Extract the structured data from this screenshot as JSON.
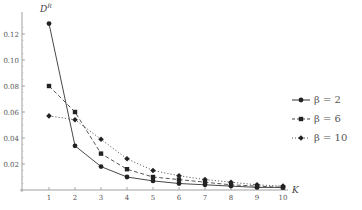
{
  "chart_data": {
    "type": "line",
    "title": "",
    "xlabel": "K",
    "ylabel": "D^R",
    "x": [
      1,
      2,
      3,
      4,
      5,
      6,
      7,
      8,
      9,
      10
    ],
    "xticks": [
      "1",
      "2",
      "3",
      "4",
      "5",
      "6",
      "7",
      "8",
      "9",
      "10"
    ],
    "yticks": [
      "0.02",
      "0.04",
      "0.06",
      "0.08",
      "0.10",
      "0.12"
    ],
    "ylim": [
      0,
      0.13
    ],
    "xlim": [
      0.5,
      10.5
    ],
    "grid": false,
    "legend_position": "right",
    "series": [
      {
        "name": "β = 2",
        "style": "solid",
        "marker": "circle",
        "values": [
          0.128,
          0.034,
          0.018,
          0.01,
          0.007,
          0.005,
          0.004,
          0.003,
          0.002,
          0.002
        ]
      },
      {
        "name": "β = 6",
        "style": "dashed",
        "marker": "square",
        "values": [
          0.08,
          0.06,
          0.028,
          0.016,
          0.01,
          0.008,
          0.006,
          0.004,
          0.003,
          0.002
        ]
      },
      {
        "name": "β = 10",
        "style": "dotted",
        "marker": "diamond",
        "values": [
          0.057,
          0.054,
          0.039,
          0.024,
          0.015,
          0.011,
          0.008,
          0.006,
          0.004,
          0.003
        ]
      }
    ]
  },
  "legend": {
    "items": [
      {
        "label": "β = 2"
      },
      {
        "label": "β = 6"
      },
      {
        "label": "β = 10"
      }
    ]
  },
  "axes": {
    "y_title_main": "D",
    "y_title_sup": "R",
    "x_title": "K"
  }
}
